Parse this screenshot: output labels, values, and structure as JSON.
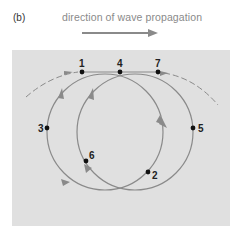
{
  "figure": {
    "panel_label": "(b)",
    "title": "direction of wave propagation",
    "colors": {
      "panel_bg": "#e0e0e0",
      "curve": "#8a8a8a",
      "arrow": "#8a8a8a",
      "point": "#111111"
    },
    "points": [
      {
        "id": "1",
        "x": 82,
        "y": 72
      },
      {
        "id": "4",
        "x": 120,
        "y": 72
      },
      {
        "id": "7",
        "x": 158,
        "y": 72
      },
      {
        "id": "3",
        "x": 47,
        "y": 128
      },
      {
        "id": "5",
        "x": 193,
        "y": 128
      },
      {
        "id": "6",
        "x": 86,
        "y": 161
      },
      {
        "id": "2",
        "x": 148,
        "y": 172
      }
    ]
  }
}
